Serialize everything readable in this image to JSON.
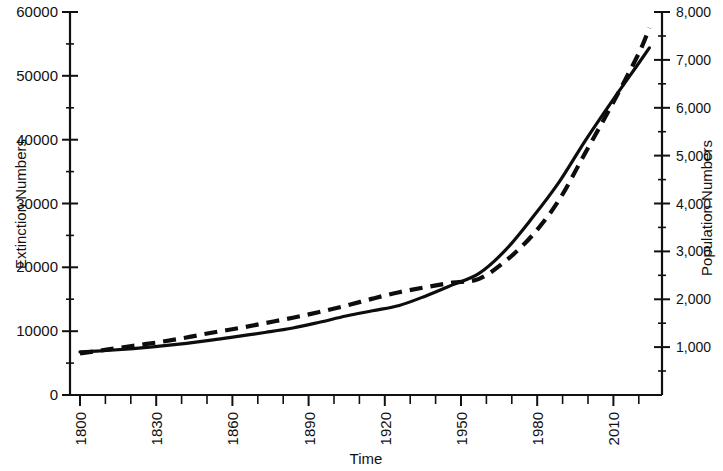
{
  "chart_data": {
    "type": "line",
    "title": "",
    "xlabel": "Time",
    "ylabel": "Extinction Numbers",
    "y2label": "Population Numbers",
    "xlim": [
      1800,
      2015
    ],
    "ylim": [
      0,
      60000
    ],
    "y2lim": [
      0,
      8000
    ],
    "grid": false,
    "legend": "none",
    "x_ticks": [
      1800,
      1830,
      1860,
      1890,
      1920,
      1950,
      1980,
      2010
    ],
    "x_tick_labels": [
      "1800",
      "1830",
      "1860",
      "1890",
      "1920",
      "1950",
      "1980",
      "2010"
    ],
    "x_minor_tick_interval": 10,
    "y_ticks": [
      0,
      10000,
      20000,
      30000,
      40000,
      50000,
      60000
    ],
    "y_tick_labels": [
      "0",
      "10000",
      "20000",
      "30000",
      "40000",
      "50000",
      "60000"
    ],
    "y2_ticks": [
      1000,
      2000,
      3000,
      4000,
      5000,
      6000,
      7000,
      8000
    ],
    "y2_tick_labels": [
      "1,000",
      "2,000",
      "3,000",
      "4,000",
      "5,000",
      "6,000",
      "7,000",
      "8,000"
    ],
    "x": [
      1800,
      1810,
      1820,
      1830,
      1840,
      1850,
      1860,
      1870,
      1880,
      1890,
      1900,
      1910,
      1920,
      1930,
      1940,
      1950,
      1960,
      1970,
      1980,
      1990,
      2000,
      2010,
      2014
    ],
    "series": [
      {
        "name": "Extinction Numbers",
        "style": "dashed",
        "axis": "left",
        "values": [
          6500,
          7100,
          7700,
          8300,
          9000,
          9800,
          10500,
          11300,
          12100,
          13000,
          14000,
          15100,
          16100,
          16900,
          17600,
          18200,
          21000,
          25000,
          30500,
          38000,
          45500,
          53500,
          57500
        ]
      },
      {
        "name": "Population Numbers",
        "style": "solid",
        "axis": "right",
        "values": [
          900,
          930,
          970,
          1020,
          1080,
          1150,
          1230,
          1310,
          1400,
          1520,
          1650,
          1760,
          1870,
          2070,
          2300,
          2540,
          3030,
          3700,
          4440,
          5320,
          6140,
          6930,
          7250
        ]
      }
    ],
    "annotations": []
  }
}
